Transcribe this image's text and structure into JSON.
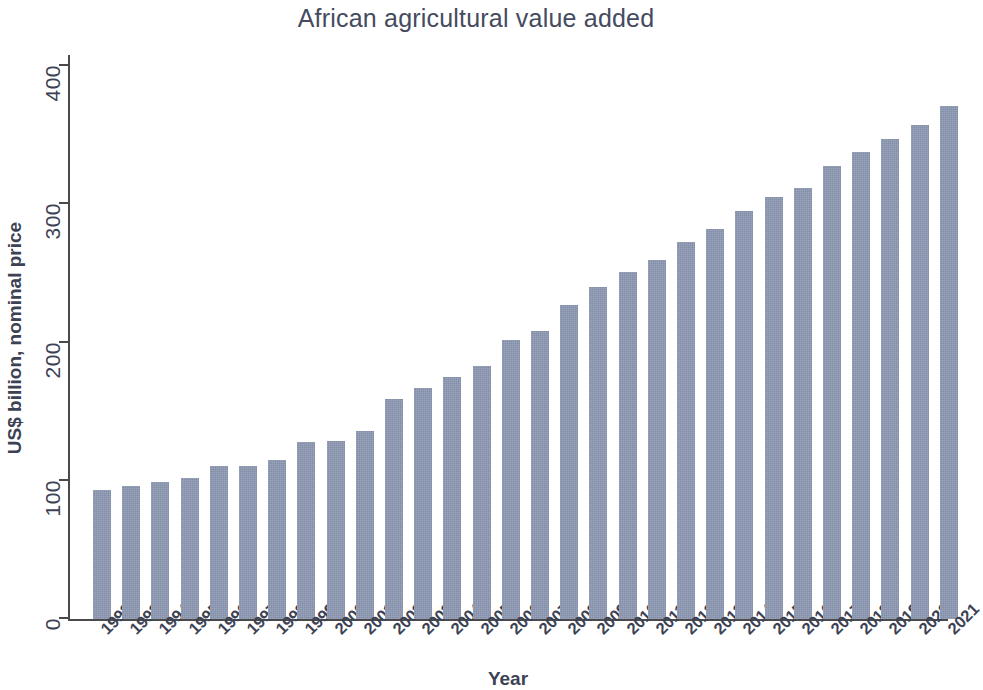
{
  "chart_data": {
    "type": "bar",
    "title": "African agricultural value added",
    "xlabel": "Year",
    "ylabel": "US$ billion, nominal price",
    "grid": false,
    "legend": null,
    "bar_color": "#8d99b4",
    "ylim": [
      0,
      420
    ],
    "yticks": [
      0,
      100,
      200,
      300,
      400
    ],
    "ytick_labels": [
      "0",
      "100",
      "200",
      "300",
      "400"
    ],
    "categories": [
      "1992",
      "1993",
      "1994",
      "1995",
      "1996",
      "1997",
      "1998",
      "1999",
      "2000",
      "2001",
      "2002",
      "2003",
      "2004",
      "2005",
      "2006",
      "2007",
      "2008",
      "2009",
      "2010",
      "2011",
      "2012",
      "2013",
      "2014",
      "2015",
      "2016",
      "2017",
      "2018",
      "2019",
      "2020",
      "2021"
    ],
    "values": [
      93,
      96,
      99,
      102,
      111,
      111,
      115,
      128,
      129,
      136,
      159,
      167,
      175,
      183,
      202,
      208,
      227,
      240,
      251,
      260,
      273,
      282,
      295,
      305,
      312,
      328,
      338,
      347,
      357,
      371
    ],
    "xtick_rotation": -45
  },
  "figure": {
    "title": "African agricultural value added",
    "x_axis_title": "Year",
    "y_axis_title": "US$ billion, nominal price"
  }
}
